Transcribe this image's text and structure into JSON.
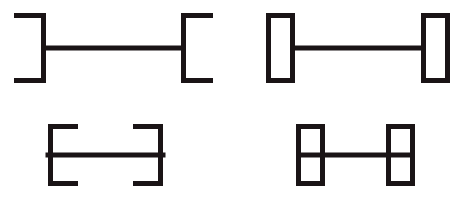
{
  "figure": {
    "canvas": {
      "width": 465,
      "height": 200,
      "background": "#ffffff"
    },
    "ink_color": "#1a1416",
    "stroke_width": 5,
    "layout": {
      "rows": 2,
      "columns": 2
    },
    "panels": [
      {
        "id": "top-left",
        "name": "open-brackets-same-direction",
        "terminator_type": "open-bracket",
        "shaft": {
          "x1": 46,
          "x2": 181,
          "y": 48,
          "length": 135
        },
        "left_end": {
          "shape": "bracket",
          "opens": "right",
          "stem_x": 46,
          "top_y": 13,
          "bottom_y": 83,
          "fin_length": 32,
          "fin_direction": "left"
        },
        "right_end": {
          "shape": "bracket",
          "opens": "right",
          "stem_x": 181,
          "top_y": 13,
          "bottom_y": 83,
          "fin_length": 32,
          "fin_direction": "right"
        }
      },
      {
        "id": "top-right",
        "name": "closed-rectangles-tall",
        "terminator_type": "closed-rectangle",
        "shaft": {
          "x1": 293,
          "x2": 423,
          "y": 48,
          "length": 130
        },
        "left_end": {
          "shape": "rectangle",
          "x": 266,
          "y": 13,
          "width": 29,
          "height": 70,
          "divided": false
        },
        "right_end": {
          "shape": "rectangle",
          "x": 421,
          "y": 13,
          "width": 29,
          "height": 70,
          "divided": false
        }
      },
      {
        "id": "bottom-left",
        "name": "open-brackets-facing-inward",
        "terminator_type": "open-bracket",
        "shaft": {
          "x1": 48,
          "x2": 163,
          "y": 155,
          "length": 115
        },
        "left_end": {
          "shape": "bracket",
          "opens": "right",
          "stem_x": 48,
          "top_y": 124,
          "bottom_y": 186,
          "fin_length": 30,
          "fin_direction": "right"
        },
        "right_end": {
          "shape": "bracket",
          "opens": "left",
          "stem_x": 163,
          "top_y": 124,
          "bottom_y": 186,
          "fin_length": 30,
          "fin_direction": "left"
        }
      },
      {
        "id": "bottom-right",
        "name": "closed-rectangles-stacked-pairs",
        "terminator_type": "closed-rectangle-pair",
        "shaft": {
          "x1": 323,
          "x2": 388,
          "y": 155,
          "length": 65
        },
        "left_end": {
          "shape": "rectangle-pair",
          "x": 296,
          "y": 124,
          "width": 29,
          "height": 62,
          "divided": true,
          "divider_y": 155
        },
        "right_end": {
          "shape": "rectangle-pair",
          "x": 386,
          "y": 124,
          "width": 29,
          "height": 62,
          "divided": true,
          "divider_y": 155
        }
      }
    ]
  }
}
